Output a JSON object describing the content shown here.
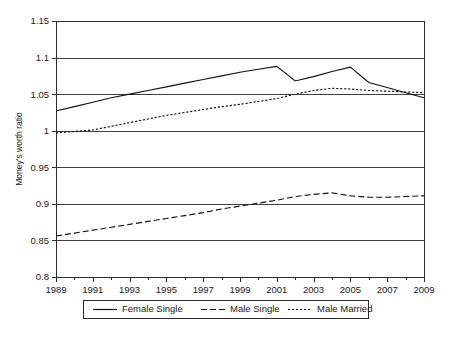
{
  "chart_data": {
    "type": "line",
    "title": "",
    "xlabel": "",
    "ylabel": "Money's worth ratio",
    "xlim": [
      1989,
      2009
    ],
    "ylim": [
      0.8,
      1.15
    ],
    "grid": true,
    "legend_position": "bottom",
    "y_ticks": [
      "0.8",
      "0.85",
      "0.9",
      "0.95",
      "1",
      "1.05",
      "1.1",
      "1.15"
    ],
    "y_tick_values": [
      0.8,
      0.85,
      0.9,
      0.95,
      1.0,
      1.05,
      1.1,
      1.15
    ],
    "x_ticks": [
      "1989",
      "1991",
      "1993",
      "1995",
      "1997",
      "1999",
      "2001",
      "2003",
      "2005",
      "2007",
      "2009"
    ],
    "x_tick_values": [
      1989,
      1991,
      1993,
      1995,
      1997,
      1999,
      2001,
      2003,
      2005,
      2007,
      2009
    ],
    "x_minor_values": [
      1990,
      1992,
      1994,
      1996,
      1998,
      2000,
      2002,
      2004,
      2006,
      2008
    ],
    "x": [
      1989,
      1990,
      1991,
      1992,
      1993,
      1994,
      1995,
      1996,
      1997,
      1998,
      1999,
      2000,
      2001,
      2002,
      2003,
      2004,
      2005,
      2006,
      2007,
      2008,
      2009
    ],
    "series": [
      {
        "name": "Female Single",
        "style": "solid",
        "color": "#111111",
        "values": [
          1.027,
          1.033,
          1.039,
          1.045,
          1.05,
          1.055,
          1.06,
          1.065,
          1.07,
          1.075,
          1.08,
          1.084,
          1.088,
          1.068,
          1.074,
          1.081,
          1.087,
          1.066,
          1.059,
          1.052,
          1.045
        ]
      },
      {
        "name": "Male Single",
        "style": "dashed",
        "color": "#111111",
        "values": [
          0.856,
          0.86,
          0.864,
          0.868,
          0.872,
          0.876,
          0.88,
          0.884,
          0.888,
          0.893,
          0.897,
          0.901,
          0.905,
          0.91,
          0.913,
          0.915,
          0.911,
          0.909,
          0.909,
          0.91,
          0.911
        ]
      },
      {
        "name": "Male Married",
        "style": "dotted",
        "color": "#111111",
        "values": [
          0.997,
          0.999,
          1.001,
          1.006,
          1.011,
          1.016,
          1.021,
          1.025,
          1.029,
          1.033,
          1.036,
          1.04,
          1.044,
          1.05,
          1.055,
          1.058,
          1.057,
          1.055,
          1.054,
          1.053,
          1.052
        ]
      }
    ]
  },
  "legend": {
    "items": [
      {
        "label": "Female Single"
      },
      {
        "label": "Male Single"
      },
      {
        "label": "Male Married"
      }
    ]
  }
}
